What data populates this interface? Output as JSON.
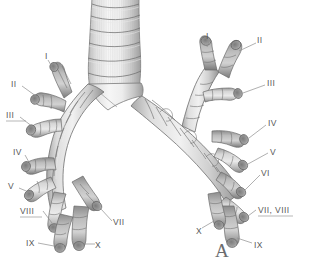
{
  "figure": {
    "panel_label": "A",
    "background_color": "#ffffff",
    "label_color": "#58595b",
    "leader_color": "#8e8e8e",
    "illustration_colors": {
      "highlight": "#f2f2f2",
      "midtone": "#c9c9c9",
      "shadow": "#9a9a9a",
      "deep_shadow": "#6f6f6f",
      "outline": "#6a6a6a"
    },
    "anatomy_parts": [
      "trachea",
      "carina",
      "right-main-bronchus",
      "left-main-bronchus",
      "segmental-bronchi"
    ]
  },
  "labels_left": [
    {
      "id": "left-I",
      "text": "I",
      "x": 45,
      "y": 52,
      "anchor": "left"
    },
    {
      "id": "left-II",
      "text": "II",
      "x": 11,
      "y": 80,
      "anchor": "left"
    },
    {
      "id": "left-III",
      "text": "III",
      "x": 6,
      "y": 111,
      "anchor": "left"
    },
    {
      "id": "left-IV",
      "text": "IV",
      "x": 13,
      "y": 148,
      "anchor": "left"
    },
    {
      "id": "left-V",
      "text": "V",
      "x": 8,
      "y": 182,
      "anchor": "left"
    },
    {
      "id": "left-VIII",
      "text": "VIII",
      "x": 20,
      "y": 207,
      "anchor": "left"
    },
    {
      "id": "left-IX",
      "text": "IX",
      "x": 26,
      "y": 239,
      "anchor": "left"
    },
    {
      "id": "left-VII",
      "text": "VII",
      "x": 113,
      "y": 218,
      "anchor": "left"
    },
    {
      "id": "left-X",
      "text": "X",
      "x": 95,
      "y": 241,
      "anchor": "left"
    }
  ],
  "labels_right": [
    {
      "id": "right-I",
      "text": "I",
      "x": 206,
      "y": 32,
      "anchor": "left"
    },
    {
      "id": "right-II",
      "text": "II",
      "x": 257,
      "y": 36,
      "anchor": "left"
    },
    {
      "id": "right-III",
      "text": "III",
      "x": 267,
      "y": 79,
      "anchor": "left"
    },
    {
      "id": "right-IV",
      "text": "IV",
      "x": 268,
      "y": 119,
      "anchor": "left"
    },
    {
      "id": "right-V",
      "text": "V",
      "x": 270,
      "y": 148,
      "anchor": "left"
    },
    {
      "id": "right-VI",
      "text": "VI",
      "x": 261,
      "y": 169,
      "anchor": "left"
    },
    {
      "id": "right-VII-VIII",
      "text": "VII, VIII",
      "x": 258,
      "y": 206,
      "anchor": "left"
    },
    {
      "id": "right-X",
      "text": "X",
      "x": 196,
      "y": 227,
      "anchor": "left"
    },
    {
      "id": "right-IX",
      "text": "IX",
      "x": 254,
      "y": 241,
      "anchor": "left"
    }
  ],
  "panel": {
    "letter": "A",
    "x": 215,
    "y": 241
  }
}
